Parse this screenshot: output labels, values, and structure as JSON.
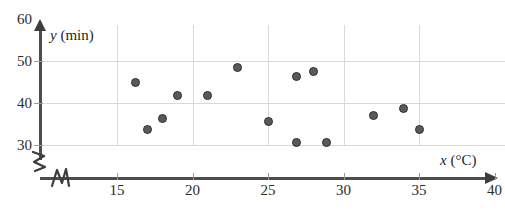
{
  "chart_data": {
    "type": "scatter",
    "title": "",
    "xlabel": "x (°C)",
    "ylabel": "y (min)",
    "x_unit": "°C",
    "y_unit": "min",
    "xlim": [
      12,
      40
    ],
    "ylim": [
      27,
      60
    ],
    "xticks": [
      15,
      20,
      25,
      30,
      35,
      40
    ],
    "yticks": [
      30,
      40,
      50,
      60
    ],
    "grid": true,
    "legend": "none",
    "axis_break_x": true,
    "axis_break_y": true,
    "marker_color": "#5a5a5a",
    "marker_edge_color": "#2e2e2e",
    "grid_color": "#d9d9d9",
    "axis_color": "#4d4d4d",
    "points": [
      {
        "x": 16.2,
        "y": 45.0
      },
      {
        "x": 17.0,
        "y": 33.8
      },
      {
        "x": 18.0,
        "y": 36.4
      },
      {
        "x": 19.0,
        "y": 41.9
      },
      {
        "x": 21.0,
        "y": 41.9
      },
      {
        "x": 23.0,
        "y": 48.4
      },
      {
        "x": 25.0,
        "y": 35.6
      },
      {
        "x": 26.9,
        "y": 46.2
      },
      {
        "x": 28.0,
        "y": 47.4
      },
      {
        "x": 26.9,
        "y": 30.7
      },
      {
        "x": 28.9,
        "y": 30.7
      },
      {
        "x": 32.0,
        "y": 37.0
      },
      {
        "x": 34.0,
        "y": 38.6
      },
      {
        "x": 35.0,
        "y": 33.8
      }
    ]
  },
  "axis": {
    "y_title_var": "y",
    "y_title_unit": "(min)",
    "x_title_var": "x",
    "x_title_unit": "(°C)"
  }
}
